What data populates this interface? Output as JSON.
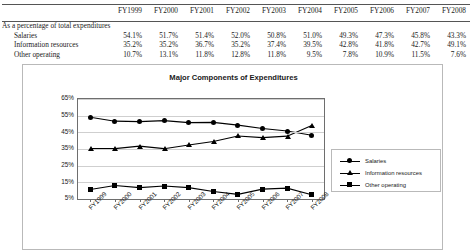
{
  "table": {
    "years": [
      "FY1999",
      "FY2000",
      "FY2001",
      "FY2002",
      "FY2003",
      "FY2004",
      "FY2005",
      "FY2006",
      "FY2007",
      "FY2008"
    ],
    "section_label": "As a percentage of total expenditures",
    "rows": [
      {
        "label": "Salaries",
        "values": [
          "54.1%",
          "51.7%",
          "51.4%",
          "52.0%",
          "50.8%",
          "51.0%",
          "49.3%",
          "47.3%",
          "45.8%",
          "43.3%"
        ]
      },
      {
        "label": "Information resources",
        "values": [
          "35.2%",
          "35.2%",
          "36.7%",
          "35.2%",
          "37.4%",
          "39.5%",
          "42.8%",
          "41.8%",
          "42.7%",
          "49.1%"
        ]
      },
      {
        "label": "Other operating",
        "values": [
          "10.7%",
          "13.1%",
          "11.8%",
          "12.8%",
          "11.8%",
          "9.5%",
          "7.8%",
          "10.9%",
          "11.5%",
          "7.6%"
        ]
      }
    ]
  },
  "chart_data": {
    "type": "line",
    "title": "Major Components of Expenditures",
    "xlabel": "",
    "ylabel": "",
    "categories": [
      "FY1999",
      "FY2000",
      "FY2001",
      "FY2002",
      "FY2003",
      "FY2004",
      "FY2005",
      "FY2006",
      "FY2007",
      "FY2008"
    ],
    "ylim": [
      5,
      65
    ],
    "yticks": [
      "5%",
      "15%",
      "25%",
      "35%",
      "45%",
      "55%",
      "65%"
    ],
    "ytick_values": [
      5,
      15,
      25,
      35,
      45,
      55,
      65
    ],
    "grid": true,
    "legend_position": "right",
    "series": [
      {
        "name": "Salaries",
        "marker": "circle",
        "values": [
          54.1,
          51.7,
          51.4,
          52.0,
          50.8,
          51.0,
          49.3,
          47.3,
          45.8,
          43.3
        ]
      },
      {
        "name": "Information resources",
        "marker": "triangle",
        "values": [
          35.2,
          35.2,
          36.7,
          35.2,
          37.4,
          39.5,
          42.8,
          41.8,
          42.7,
          49.1
        ]
      },
      {
        "name": "Other operating",
        "marker": "square",
        "values": [
          10.7,
          13.1,
          11.8,
          12.8,
          11.8,
          9.5,
          7.8,
          10.9,
          11.5,
          7.6
        ]
      }
    ],
    "colors": {
      "line": "#000000",
      "grid": "#cfcfcf",
      "axis": "#6e6e6e",
      "frame": "#b9b9b9"
    }
  }
}
